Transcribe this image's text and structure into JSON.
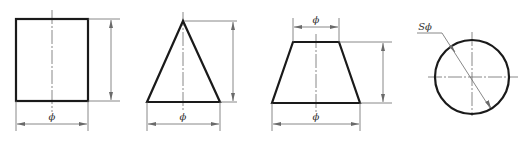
{
  "figure": {
    "shapes": [
      {
        "name": "cylinder",
        "view": "rectangle",
        "dimension_labels": {
          "diameter": "ϕ"
        }
      },
      {
        "name": "cone",
        "view": "triangle",
        "dimension_labels": {
          "diameter": "ϕ"
        }
      },
      {
        "name": "truncated-cone",
        "view": "trapezoid",
        "dimension_labels": {
          "top_diameter": "ϕ",
          "bottom_diameter": "ϕ"
        }
      },
      {
        "name": "sphere",
        "view": "circle",
        "dimension_labels": {
          "sphere_diameter": "Sϕ"
        }
      }
    ]
  },
  "colors": {
    "outline": "#1a1a1a",
    "dimension": "#6a6a6a",
    "background": "#ffffff"
  }
}
